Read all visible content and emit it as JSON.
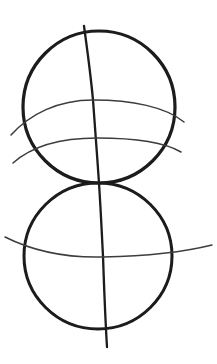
{
  "canvas": {
    "width": 217,
    "height": 364,
    "background_color": "#ffffff",
    "ink_color": "#1a1a1a",
    "ink_color_light": "#3d3d3d",
    "title": "Two tangent circles construction sketch"
  },
  "drawing": {
    "medium": "pencil-sketch",
    "description": "Hand-drawn construction sketch of two vertically stacked tangent circles with a curving vertical meridian and horizontal latitude arcs",
    "shape_count": 6,
    "shapes": [
      {
        "id": "upper-circle",
        "name": "upper-circle",
        "type": "circle",
        "cx": 99,
        "cy": 107,
        "rx": 76,
        "ry": 76,
        "stroke_width": 3.2,
        "color": "#1a1a1a",
        "path": "M 99 31 C 141 31 175 65 175 107 C 175 149 141 183 99 183 C 57 183 23 149 23 107 C 23 65 57 31 99 31 Z"
      },
      {
        "id": "lower-circle",
        "name": "lower-circle",
        "type": "circle",
        "cx": 98,
        "cy": 256,
        "rx": 74,
        "ry": 73,
        "stroke_width": 3.0,
        "color": "#1a1a1a",
        "path": "M 98 183 C 139 183 172 216 172 256 C 172 296 139 329 98 329 C 57 329 24 296 24 256 C 24 216 57 183 98 183 Z"
      },
      {
        "id": "meridian",
        "name": "vertical-meridian-curve",
        "type": "open-curve",
        "stroke_width": 2.3,
        "color": "#1a1a1a",
        "start": [
          84,
          26
        ],
        "end": [
          107,
          347
        ],
        "path": "M 84 26 C 88 55 91 78 93 100 C 95 125 97 155 99 183 C 101 214 102 238 103 256 C 104 285 105 315 107 347"
      },
      {
        "id": "upper-arc-1",
        "name": "upper-latitude-arc-upper",
        "type": "open-curve",
        "stroke_width": 1.5,
        "color": "#3d3d3d",
        "start": [
          11,
          135
        ],
        "end": [
          184,
          122
        ],
        "crosses_meridian_at_y": 100,
        "path": "M 11 135 C 30 114 58 100 93 100 C 132 100 166 107 184 122"
      },
      {
        "id": "upper-arc-2",
        "name": "upper-latitude-arc-lower",
        "type": "open-curve",
        "stroke_width": 1.5,
        "color": "#3d3d3d",
        "start": [
          13,
          163
        ],
        "end": [
          181,
          152
        ],
        "crosses_meridian_at_y": 138,
        "path": "M 13 163 C 32 146 60 138 97 138 C 134 138 164 142 181 152"
      },
      {
        "id": "lower-arc-1",
        "name": "lower-latitude-arc",
        "type": "open-curve",
        "stroke_width": 1.5,
        "color": "#3d3d3d",
        "start": [
          5,
          237
        ],
        "end": [
          212,
          245
        ],
        "crosses_meridian_at_y": 256,
        "path": "M 5 237 C 35 252 66 258 103 257 C 150 256 188 251 212 245"
      }
    ]
  }
}
